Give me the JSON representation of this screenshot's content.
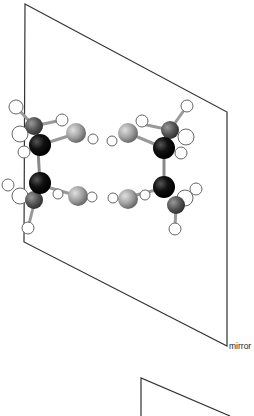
{
  "diagram": {
    "plane_label": "mirror",
    "colors": {
      "plane_edge": "#333333",
      "carbon_black": "#0a0a0a",
      "carbon_gray": "#555555",
      "heteroatom": "#9a9a9a",
      "hydrogen": "#ffffff"
    }
  }
}
